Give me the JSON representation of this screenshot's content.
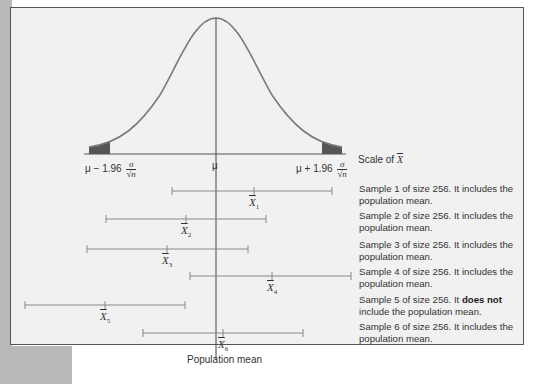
{
  "figure": {
    "axis_label_prefix": "Scale of ",
    "axis_label_symbol": "X",
    "tick_labels": {
      "left": "μ − 1.96",
      "center": "μ",
      "right": "μ + 1.96",
      "fraction_numerator": "σ",
      "fraction_denominator": "√n"
    },
    "population_mean_label": "Population mean",
    "samples": [
      {
        "id": 1,
        "sub": "1",
        "text_pre": "Sample 1 of size 256. It includes the population mean.",
        "text_bold": "",
        "text_post": ""
      },
      {
        "id": 2,
        "sub": "2",
        "text_pre": "Sample 2 of size 256. It includes the population mean.",
        "text_bold": "",
        "text_post": ""
      },
      {
        "id": 3,
        "sub": "3",
        "text_pre": "Sample 3 of size 256. It includes the population mean.",
        "text_bold": "",
        "text_post": ""
      },
      {
        "id": 4,
        "sub": "4",
        "text_pre": "Sample 4 of size 256. It includes the population mean.",
        "text_bold": "",
        "text_post": ""
      },
      {
        "id": 5,
        "sub": "5",
        "text_pre": "Sample 5 of size 256. It ",
        "text_bold": "does not",
        "text_post": " include the population mean."
      },
      {
        "id": 6,
        "sub": "6",
        "text_pre": "Sample 6 of size 256. It includes the population mean.",
        "text_bold": "",
        "text_post": ""
      }
    ],
    "colors": {
      "curve": "#777777",
      "tail_fill": "#555555",
      "interval_line": "#777777",
      "panel_bg": "#f1f1f1"
    }
  }
}
